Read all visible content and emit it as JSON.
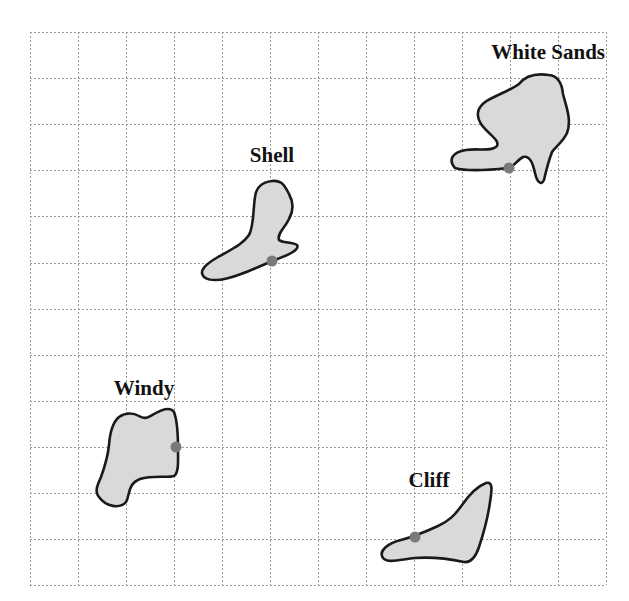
{
  "map": {
    "width": 629,
    "height": 601,
    "grid": {
      "left": 30,
      "top": 32,
      "columns": 12,
      "rows": 12,
      "cell_width": 48,
      "cell_height": 46.1,
      "line_color": "#9a9a9a",
      "line_style": "dotted"
    },
    "colors": {
      "region_fill": "#d9d9d9",
      "region_outline": "#1a1a1a",
      "dot": "#7a7a7a",
      "label": "#111111"
    },
    "regions": [
      {
        "id": "white-sands",
        "label": "White Sands",
        "label_x": 605,
        "label_y": 59,
        "label_anchor": "end",
        "dot": {
          "x": 509,
          "y": 168
        },
        "icon": "location-dot"
      },
      {
        "id": "shell",
        "label": "Shell",
        "label_x": 272,
        "label_y": 162,
        "label_anchor": "middle",
        "dot": {
          "x": 272,
          "y": 261
        },
        "icon": "location-dot"
      },
      {
        "id": "windy",
        "label": "Windy",
        "label_x": 144,
        "label_y": 395,
        "label_anchor": "middle",
        "dot": {
          "x": 176,
          "y": 447
        },
        "icon": "location-dot"
      },
      {
        "id": "cliff",
        "label": "Cliff",
        "label_x": 429,
        "label_y": 487,
        "label_anchor": "middle",
        "dot": {
          "x": 415,
          "y": 537
        },
        "icon": "location-dot"
      }
    ]
  }
}
